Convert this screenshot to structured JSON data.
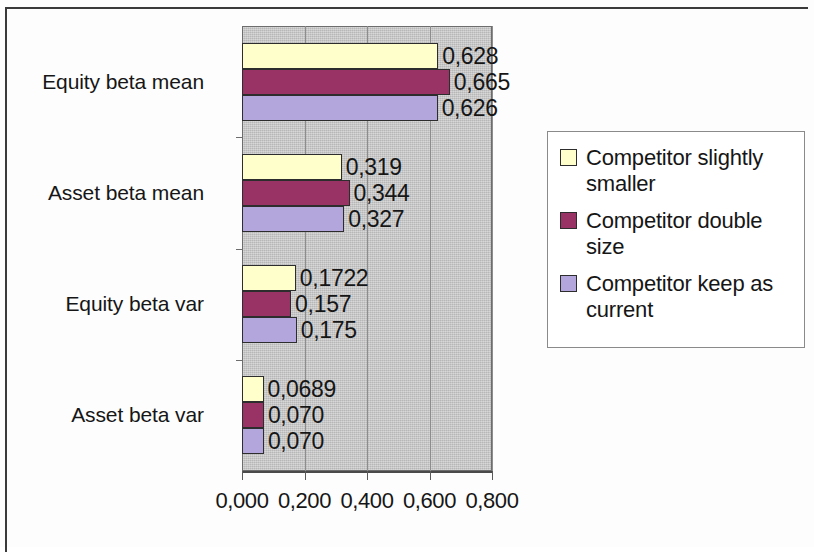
{
  "chart_data": {
    "type": "bar",
    "orientation": "horizontal",
    "title": "",
    "xlabel": "",
    "ylabel": "",
    "xlim": [
      0,
      0.8
    ],
    "grid": true,
    "legend_position": "right",
    "categories": [
      "Equity beta mean",
      "Asset beta mean",
      "Equity beta var",
      "Asset beta var"
    ],
    "xticks": [
      "0,000",
      "0,200",
      "0,400",
      "0,600",
      "0,800"
    ],
    "xtick_values": [
      0,
      0.2,
      0.4,
      0.6,
      0.8
    ],
    "series": [
      {
        "name": "Competitor slightly smaller",
        "color": "#ffffcc",
        "values": [
          0.628,
          0.319,
          0.1722,
          0.0689
        ],
        "labels": [
          "0,628",
          "0,319",
          "0,1722",
          "0,0689"
        ]
      },
      {
        "name": "Competitor double size",
        "color": "#993366",
        "values": [
          0.665,
          0.344,
          0.157,
          0.07
        ],
        "labels": [
          "0,665",
          "0,344",
          "0,157",
          "0,070"
        ]
      },
      {
        "name": "Competitor keep as current",
        "color": "#b3a6dd",
        "values": [
          0.626,
          0.327,
          0.175,
          0.07
        ],
        "labels": [
          "0,626",
          "0,327",
          "0,175",
          "0,070"
        ]
      }
    ]
  },
  "legend": {
    "items": [
      {
        "label": "Competitor slightly smaller",
        "color": "#ffffcc"
      },
      {
        "label": "Competitor double size",
        "color": "#993366"
      },
      {
        "label": "Competitor keep as current",
        "color": "#b3a6dd"
      }
    ]
  },
  "plot": {
    "background": "#c9c9c9",
    "gridline_color": "#8d8d8d"
  }
}
